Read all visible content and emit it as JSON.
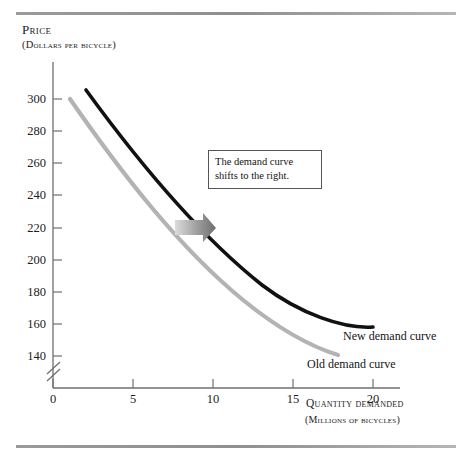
{
  "figure": {
    "y_axis": {
      "title": "Price",
      "subtitle": "(Dollars per bicycle)",
      "ticks": [
        300,
        280,
        260,
        240,
        220,
        200,
        180,
        160,
        140
      ],
      "origin_label": ""
    },
    "x_axis": {
      "title": "Quantity demanded",
      "subtitle": "(Millions of bicycles)",
      "ticks": [
        0,
        5,
        10,
        15,
        20
      ]
    },
    "annotation": {
      "text": "The demand curve shifts to the right."
    },
    "labels": {
      "new_curve": "New demand curve",
      "old_curve": "Old demand curve"
    },
    "colors": {
      "new_curve": "#111111",
      "old_curve": "#b3b3b3",
      "axis": "#6f6f6f",
      "rule": "#9a9a9a",
      "arrow_dark": "#7d7d7d",
      "arrow_light": "#d8d8d8"
    }
  },
  "chart_data": {
    "type": "line",
    "title": "",
    "xlabel": "Quantity demanded (millions of bicycles)",
    "ylabel": "Price (dollars per bicycle)",
    "xlim": [
      0,
      21
    ],
    "ylim": [
      130,
      310
    ],
    "grid": false,
    "y_axis_break": true,
    "xticks": [
      0,
      5,
      10,
      15,
      20
    ],
    "yticks": [
      140,
      160,
      180,
      200,
      220,
      240,
      260,
      280,
      300
    ],
    "legend": "inline-labels",
    "series": [
      {
        "name": "New demand curve",
        "color": "#111111",
        "points": [
          {
            "x": 2.1,
            "y": 304
          },
          {
            "x": 3.5,
            "y": 285
          },
          {
            "x": 5.0,
            "y": 268
          },
          {
            "x": 6.5,
            "y": 253
          },
          {
            "x": 8.0,
            "y": 240
          },
          {
            "x": 10.0,
            "y": 225
          },
          {
            "x": 12.0,
            "y": 210
          },
          {
            "x": 14.0,
            "y": 196
          },
          {
            "x": 16.0,
            "y": 182
          },
          {
            "x": 18.0,
            "y": 169
          },
          {
            "x": 20.0,
            "y": 156
          }
        ]
      },
      {
        "name": "Old demand curve",
        "color": "#b3b3b3",
        "points": [
          {
            "x": 1.1,
            "y": 299
          },
          {
            "x": 2.5,
            "y": 280
          },
          {
            "x": 4.0,
            "y": 262
          },
          {
            "x": 5.5,
            "y": 246
          },
          {
            "x": 7.0,
            "y": 232
          },
          {
            "x": 9.0,
            "y": 216
          },
          {
            "x": 11.0,
            "y": 201
          },
          {
            "x": 13.0,
            "y": 186
          },
          {
            "x": 15.0,
            "y": 172
          },
          {
            "x": 17.0,
            "y": 158
          },
          {
            "x": 17.8,
            "y": 152
          },
          {
            "x": 17.9,
            "y": 141
          }
        ]
      }
    ],
    "annotations": [
      {
        "text": "The demand curve shifts to the right.",
        "type": "callout-box",
        "pointer_to": {
          "x": 12.1,
          "y": 214
        }
      },
      {
        "type": "shift-arrow",
        "direction": "right",
        "from": {
          "x": 7.6,
          "y": 220
        },
        "to": {
          "x": 10.1,
          "y": 220
        }
      }
    ]
  }
}
